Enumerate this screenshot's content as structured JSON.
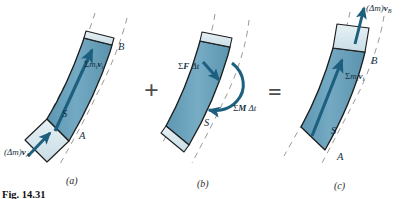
{
  "figure": {
    "caption": "Fig. 14.31",
    "colors": {
      "body_fill": "#6ba3bd",
      "body_fill_dark": "#4e8aa6",
      "cap_fill": "#d6e6ec",
      "outline": "#1d1d1d",
      "vector": "#1d5f7e",
      "dashed_guide": "#8e8e8e",
      "operator": "#4d4d4d",
      "background": "#ffffff"
    },
    "panels": [
      {
        "id": "a",
        "panel_label": "(a)",
        "point_labels": [
          {
            "name": "point-label-b",
            "text": "B"
          },
          {
            "name": "point-label-a",
            "text": "A"
          },
          {
            "name": "system-label-s",
            "text": "S"
          }
        ],
        "vectors": [
          {
            "name": "momentum-vector",
            "label_sigma": "Σ",
            "label_body": "m",
            "label_sub1": "i",
            "label_body2": "v",
            "label_sub2": "i"
          },
          {
            "name": "inflow-momentum-vector",
            "label_prefix": "(Δm)",
            "label_body": "v",
            "label_sub": "A"
          }
        ]
      },
      {
        "id": "b",
        "panel_label": "(b)",
        "point_labels": [
          {
            "name": "system-label-s",
            "text": "S"
          }
        ],
        "vectors": [
          {
            "name": "force-impulse-vector",
            "label_sigma": "Σ",
            "label_body": "F",
            "label_delta": "Δt"
          },
          {
            "name": "moment-impulse-vector",
            "label_sigma": "Σ",
            "label_body": "M",
            "label_delta": "Δt"
          }
        ]
      },
      {
        "id": "c",
        "panel_label": "(c)",
        "point_labels": [
          {
            "name": "point-label-b",
            "text": "B"
          },
          {
            "name": "point-label-a",
            "text": "A"
          },
          {
            "name": "system-label-s",
            "text": "S"
          }
        ],
        "vectors": [
          {
            "name": "momentum-vector",
            "label_sigma": "Σ",
            "label_body": "m",
            "label_sub1": "i",
            "label_body2": "v",
            "label_sub2": "i"
          },
          {
            "name": "outflow-momentum-vector",
            "label_prefix": "(Δm)",
            "label_body": "v",
            "label_sub": "B"
          }
        ]
      }
    ],
    "operators": [
      {
        "name": "plus-operator",
        "symbol": "+"
      },
      {
        "name": "equals-operator",
        "symbol": "="
      }
    ]
  }
}
